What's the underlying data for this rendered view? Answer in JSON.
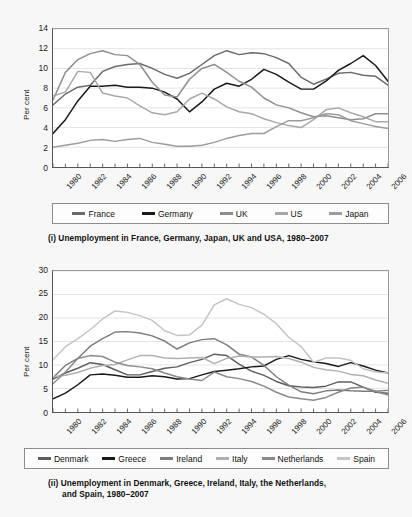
{
  "figure": {
    "background": "#f7f7f7",
    "plot_background": "#ffffff"
  },
  "panel1": {
    "axis_label": "Per cent",
    "caption": "(i) Unemployment in France, Germany, Japan, UK and USA, 1980–2007",
    "legend": [
      {
        "label": "France",
        "color": "#6b6b6b"
      },
      {
        "label": "Germany",
        "color": "#1a1a1a"
      },
      {
        "label": "UK",
        "color": "#8f8f8f"
      },
      {
        "label": "US",
        "color": "#a8a8a8"
      },
      {
        "label": "Japan",
        "color": "#9c9c9c"
      }
    ]
  },
  "panel2": {
    "axis_label": "Per cent",
    "caption_line1": "(ii) Unemployment in Denmark, Greece, Ireland, Italy, the Netherlands,",
    "caption_line2": "and Spain, 1980–2007",
    "legend": [
      {
        "label": "Denmark",
        "color": "#5e5e5e"
      },
      {
        "label": "Greece",
        "color": "#1a1a1a"
      },
      {
        "label": "Ireland",
        "color": "#7d7d7d"
      },
      {
        "label": "Italy",
        "color": "#b0b0b0"
      },
      {
        "label": "Netherlands",
        "color": "#8a8a8a"
      },
      {
        "label": "Spain",
        "color": "#c4c4c4"
      }
    ]
  },
  "chart_data": [
    {
      "type": "line",
      "id": "chart-i",
      "title": "(i) Unemployment in France, Germany, Japan, UK and USA, 1980–2007",
      "xlabel": "",
      "ylabel": "Per cent",
      "grid": true,
      "legend_position": "bottom",
      "xlim": [
        1980,
        2007
      ],
      "ylim": [
        0,
        14
      ],
      "yticks": [
        0,
        2,
        4,
        6,
        8,
        10,
        12,
        14
      ],
      "xticks": [
        1980,
        1982,
        1984,
        1986,
        1988,
        1990,
        1992,
        1994,
        1996,
        1998,
        2000,
        2002,
        2004,
        2006
      ],
      "x": [
        1980,
        1981,
        1982,
        1983,
        1984,
        1985,
        1986,
        1987,
        1988,
        1989,
        1990,
        1991,
        1992,
        1993,
        1994,
        1995,
        1996,
        1997,
        1998,
        1999,
        2000,
        2001,
        2002,
        2003,
        2004,
        2005,
        2006,
        2007
      ],
      "series": [
        {
          "name": "France",
          "color": "#6b6b6b",
          "values": [
            6.3,
            7.4,
            8.1,
            8.3,
            9.7,
            10.2,
            10.4,
            10.5,
            10.0,
            9.4,
            9.0,
            9.5,
            10.4,
            11.3,
            11.8,
            11.4,
            11.6,
            11.5,
            11.1,
            10.5,
            9.1,
            8.4,
            8.9,
            9.5,
            9.6,
            9.3,
            9.2,
            8.3
          ]
        },
        {
          "name": "Germany",
          "color": "#1a1a1a",
          "values": [
            3.4,
            4.8,
            6.7,
            8.2,
            8.2,
            8.3,
            8.1,
            8.1,
            8.0,
            7.6,
            6.9,
            5.6,
            6.6,
            7.9,
            8.5,
            8.2,
            8.9,
            9.9,
            9.4,
            8.6,
            7.9,
            7.9,
            8.7,
            9.8,
            10.5,
            11.3,
            10.3,
            8.7
          ]
        },
        {
          "name": "UK",
          "color": "#8f8f8f",
          "values": [
            6.8,
            9.6,
            10.9,
            11.5,
            11.8,
            11.4,
            11.3,
            10.4,
            8.6,
            7.3,
            7.1,
            8.9,
            10.0,
            10.4,
            9.6,
            8.7,
            8.1,
            7.0,
            6.3,
            6.0,
            5.5,
            5.1,
            5.2,
            5.0,
            4.8,
            4.9,
            5.4,
            5.4
          ]
        },
        {
          "name": "US",
          "color": "#a8a8a8",
          "values": [
            7.2,
            7.6,
            9.7,
            9.6,
            7.5,
            7.2,
            7.0,
            6.2,
            5.5,
            5.3,
            5.6,
            6.9,
            7.5,
            6.9,
            6.1,
            5.6,
            5.4,
            4.9,
            4.5,
            4.2,
            4.0,
            4.8,
            5.8,
            6.0,
            5.5,
            5.1,
            4.6,
            4.6
          ]
        },
        {
          "name": "Japan",
          "color": "#9c9c9c",
          "values": [
            2.0,
            2.2,
            2.4,
            2.7,
            2.8,
            2.6,
            2.8,
            2.9,
            2.5,
            2.3,
            2.1,
            2.1,
            2.2,
            2.5,
            2.9,
            3.2,
            3.4,
            3.4,
            4.1,
            4.7,
            4.7,
            5.0,
            5.4,
            5.3,
            4.7,
            4.4,
            4.1,
            3.9
          ]
        }
      ]
    },
    {
      "type": "line",
      "id": "chart-ii",
      "title": "(ii) Unemployment in Denmark, Greece, Ireland, Italy, the Netherlands, and Spain, 1980–2007",
      "xlabel": "",
      "ylabel": "Per cent",
      "grid": true,
      "legend_position": "bottom",
      "xlim": [
        1980,
        2007
      ],
      "ylim": [
        0,
        30
      ],
      "yticks": [
        0,
        5,
        10,
        15,
        20,
        25,
        30
      ],
      "xticks": [
        1980,
        1982,
        1984,
        1986,
        1988,
        1990,
        1992,
        1994,
        1996,
        1998,
        2000,
        2002,
        2004,
        2006
      ],
      "x": [
        1980,
        1981,
        1982,
        1983,
        1984,
        1985,
        1986,
        1987,
        1988,
        1989,
        1990,
        1991,
        1992,
        1993,
        1994,
        1995,
        1996,
        1997,
        1998,
        1999,
        2000,
        2001,
        2002,
        2003,
        2004,
        2005,
        2006,
        2007
      ],
      "series": [
        {
          "name": "Denmark",
          "color": "#5e5e5e",
          "values": [
            7.0,
            8.3,
            9.3,
            10.5,
            10.1,
            9.0,
            7.9,
            7.9,
            8.6,
            9.3,
            9.6,
            10.5,
            11.2,
            12.3,
            12.0,
            10.2,
            8.7,
            7.8,
            6.5,
            5.6,
            5.3,
            5.2,
            5.5,
            6.4,
            6.4,
            5.3,
            4.2,
            4.0
          ]
        },
        {
          "name": "Greece",
          "color": "#1a1a1a",
          "values": [
            2.8,
            4.0,
            5.8,
            7.9,
            8.1,
            7.8,
            7.4,
            7.4,
            7.7,
            7.5,
            7.0,
            7.1,
            7.9,
            8.6,
            8.9,
            9.2,
            9.6,
            9.8,
            11.2,
            12.0,
            11.2,
            10.7,
            10.3,
            9.7,
            10.5,
            9.8,
            8.9,
            8.3
          ]
        },
        {
          "name": "Ireland",
          "color": "#7d7d7d",
          "values": [
            7.3,
            9.9,
            11.4,
            14.0,
            15.6,
            17.0,
            17.1,
            16.8,
            16.2,
            15.1,
            13.4,
            14.7,
            15.4,
            15.6,
            14.3,
            12.3,
            11.7,
            9.9,
            7.5,
            5.7,
            4.3,
            3.9,
            4.5,
            4.7,
            4.5,
            4.4,
            4.4,
            4.6
          ]
        },
        {
          "name": "Italy",
          "color": "#b0b0b0",
          "values": [
            7.5,
            7.8,
            8.4,
            9.3,
            9.9,
            10.1,
            11.1,
            12.0,
            12.0,
            11.5,
            11.4,
            11.5,
            11.6,
            10.3,
            11.4,
            11.9,
            11.7,
            11.7,
            11.8,
            11.4,
            10.6,
            9.5,
            9.0,
            8.7,
            8.0,
            7.7,
            6.8,
            6.1
          ]
        },
        {
          "name": "Netherlands",
          "color": "#8a8a8a",
          "values": [
            6.0,
            8.5,
            11.4,
            12.0,
            11.8,
            10.6,
            9.9,
            9.6,
            9.2,
            8.3,
            7.5,
            7.0,
            6.7,
            8.5,
            7.5,
            7.1,
            6.5,
            5.5,
            4.2,
            3.2,
            2.8,
            2.5,
            3.1,
            4.2,
            5.1,
            5.3,
            4.4,
            3.6
          ]
        },
        {
          "name": "Spain",
          "color": "#c4c4c4",
          "values": [
            11.1,
            13.9,
            15.6,
            17.5,
            19.8,
            21.5,
            21.2,
            20.5,
            19.5,
            17.3,
            16.3,
            16.4,
            18.5,
            22.8,
            24.1,
            22.9,
            22.2,
            20.8,
            18.8,
            15.9,
            13.9,
            10.6,
            11.5,
            11.5,
            11.0,
            9.2,
            8.5,
            8.3
          ]
        }
      ]
    }
  ]
}
